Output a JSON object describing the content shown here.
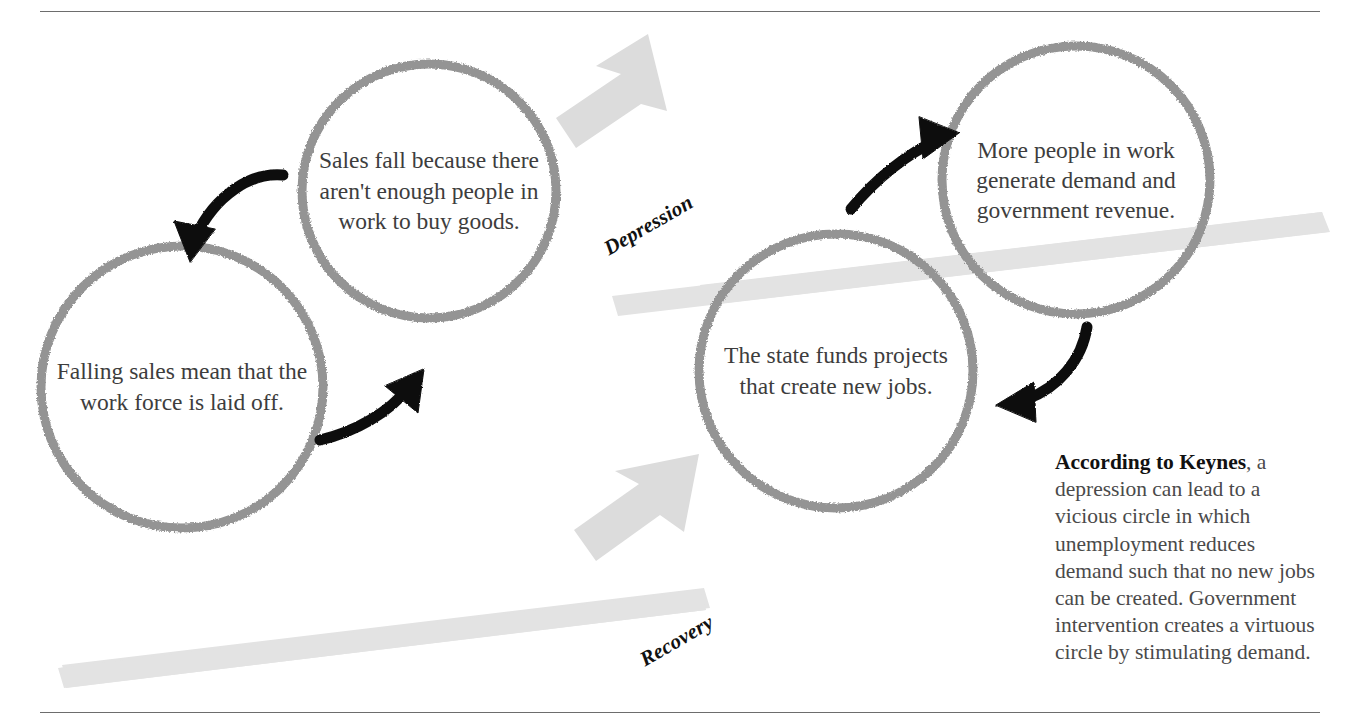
{
  "diagram": {
    "title_labels": {
      "depression": "Depression",
      "recovery": "Recovery"
    },
    "circles": [
      {
        "id": "falling-sales",
        "text": "Falling sales mean that the work force is laid off.",
        "cycle": "depression",
        "order": 1
      },
      {
        "id": "sales-fall",
        "text": "Sales fall because there aren't enough people in work to buy goods.",
        "cycle": "depression",
        "order": 2
      },
      {
        "id": "state-funds-projects",
        "text": "The state funds projects that create new jobs.",
        "cycle": "recovery",
        "order": 1
      },
      {
        "id": "more-people-in-work",
        "text": "More people in work generate demand and government revenue.",
        "cycle": "recovery",
        "order": 2
      }
    ],
    "caption": {
      "lead": "According to Keynes",
      "body": ", a depression can lead to a vicious circle in which unemployment reduces demand such that no new jobs can be created. Government intervention creates a virtuous circle by stimulating demand."
    },
    "colors": {
      "circle_stroke": "#949494",
      "slope_band": "#e2e2e2",
      "block_arrow": "#dcdcdc",
      "flow_arrow": "#0d0d0d",
      "rule": "#6d6d6d",
      "text": "#3d3d3d",
      "background": "#ffffff"
    },
    "icons": {
      "block_arrow_down_left": "block-arrow-down-left-icon",
      "block_arrow_up_right": "block-arrow-up-right-icon",
      "flow_arrow": "curved-arrow-icon"
    }
  }
}
